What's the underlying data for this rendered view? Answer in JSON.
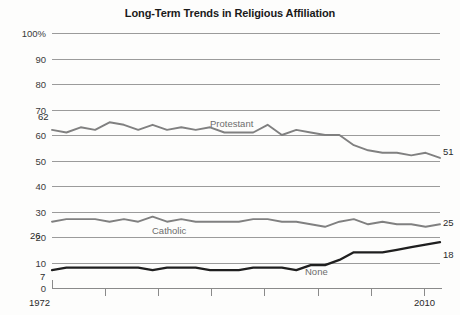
{
  "title": "Long-Term Trends in Religious Affiliation",
  "axis": {
    "y_ticks": [
      "100%",
      "90",
      "80",
      "70",
      "60",
      "50",
      "40",
      "30",
      "20",
      "10",
      "0"
    ],
    "x_start": "1972",
    "x_end": "2010"
  },
  "annotations": {
    "protestant_start": "62",
    "protestant_end": "51",
    "catholic_start": "26",
    "catholic_end": "25",
    "none_start": "7",
    "none_end": "18",
    "protestant_label": "Protestant",
    "catholic_label": "Catholic",
    "none_label": "None"
  },
  "colors": {
    "protestant": "#808080",
    "catholic": "#808080",
    "none": "#1f1f1f",
    "grid": "#9b9b9b",
    "text": "#2a2a2a",
    "label": "#6d6d6d"
  },
  "chart_data": {
    "type": "line",
    "title": "Long-Term Trends in Religious Affiliation",
    "xlabel": "",
    "ylabel": "",
    "ylim": [
      0,
      100
    ],
    "xlim": [
      1972,
      2010
    ],
    "grid": true,
    "legend": "inline-labels",
    "x": [
      1972,
      1973,
      1974,
      1975,
      1976,
      1977,
      1978,
      1980,
      1982,
      1983,
      1984,
      1985,
      1986,
      1987,
      1988,
      1989,
      1990,
      1991,
      1993,
      1994,
      1996,
      1998,
      2000,
      2002,
      2004,
      2006,
      2008,
      2010
    ],
    "series": [
      {
        "name": "Protestant",
        "color": "#808080",
        "start_value": 62,
        "end_value": 51,
        "values": [
          62,
          61,
          63,
          62,
          65,
          64,
          62,
          64,
          62,
          63,
          62,
          63,
          61,
          61,
          61,
          64,
          60,
          62,
          61,
          60,
          60,
          56,
          54,
          53,
          53,
          52,
          53,
          51
        ]
      },
      {
        "name": "Catholic",
        "color": "#808080",
        "start_value": 26,
        "end_value": 25,
        "values": [
          26,
          27,
          27,
          27,
          26,
          27,
          26,
          28,
          26,
          27,
          26,
          26,
          26,
          26,
          27,
          27,
          26,
          26,
          25,
          24,
          26,
          27,
          25,
          26,
          25,
          25,
          24,
          25
        ]
      },
      {
        "name": "None",
        "color": "#1f1f1f",
        "start_value": 7,
        "end_value": 18,
        "values": [
          7,
          8,
          8,
          8,
          8,
          8,
          8,
          7,
          8,
          8,
          8,
          7,
          7,
          7,
          8,
          8,
          8,
          7,
          9,
          9,
          11,
          14,
          14,
          14,
          15,
          16,
          17,
          18
        ]
      }
    ]
  }
}
